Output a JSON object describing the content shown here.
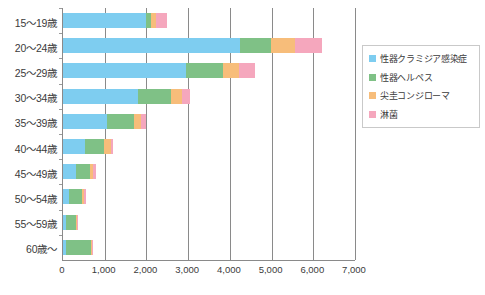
{
  "chart_data": {
    "type": "bar",
    "orientation": "horizontal",
    "stacked": true,
    "title": "",
    "xlabel": "",
    "ylabel": "",
    "xlim": [
      0,
      7000
    ],
    "xticks": [
      0,
      1000,
      2000,
      3000,
      4000,
      5000,
      6000,
      7000
    ],
    "xtick_labels": [
      "0",
      "1,000",
      "2,000",
      "3,000",
      "4,000",
      "5,000",
      "6,000",
      "7,000"
    ],
    "grid": true,
    "legend_position": "right",
    "categories": [
      "15～19歳",
      "20～24歳",
      "25～29歳",
      "30～34歳",
      "35～39歳",
      "40～44歳",
      "45～49歳",
      "50～54歳",
      "55～59歳",
      "60歳～"
    ],
    "series": [
      {
        "name": "性器クラミジア感染症",
        "color": "#7ecdf0",
        "values": [
          1980,
          4250,
          2950,
          1800,
          1060,
          520,
          300,
          150,
          70,
          60
        ]
      },
      {
        "name": "性器ヘルペス",
        "color": "#7fc186",
        "values": [
          130,
          740,
          880,
          800,
          640,
          470,
          340,
          300,
          230,
          600
        ]
      },
      {
        "name": "尖圭コンジローマ",
        "color": "#f7bd7a",
        "values": [
          130,
          580,
          380,
          250,
          180,
          160,
          90,
          60,
          30,
          40
        ]
      },
      {
        "name": "淋菌",
        "color": "#f5a7bd",
        "values": [
          260,
          630,
          400,
          190,
          110,
          60,
          50,
          30,
          20,
          30
        ]
      }
    ]
  },
  "legend": {
    "items": [
      {
        "label": "性器クラミジア感染症",
        "color": "#7ecdf0"
      },
      {
        "label": "性器ヘルペス",
        "color": "#7fc186"
      },
      {
        "label": "尖圭コンジローマ",
        "color": "#f7bd7a"
      },
      {
        "label": "淋菌",
        "color": "#f5a7bd"
      }
    ]
  },
  "colors": {
    "axis": "#8a8a8a",
    "text": "#3b3b3b",
    "background": "#ffffff"
  }
}
